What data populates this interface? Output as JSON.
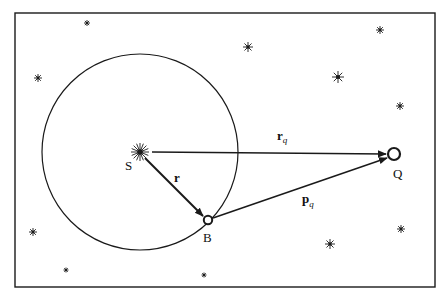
{
  "diagram": {
    "colors": {
      "stroke": "#1a1a1a",
      "background": "#ffffff"
    },
    "frame": {
      "x": 15,
      "y": 13,
      "width": 420,
      "height": 274
    },
    "circle": {
      "cx": 140,
      "cy": 152,
      "r": 98
    },
    "points": {
      "S": {
        "x": 140,
        "y": 152,
        "label": "S",
        "icon": "sun-burst"
      },
      "B": {
        "x": 208,
        "y": 220,
        "label": "B",
        "icon": "open-circle"
      },
      "Q": {
        "x": 394,
        "y": 154,
        "label": "Q",
        "icon": "open-circle"
      }
    },
    "vectors": {
      "r": {
        "from": "S",
        "to": "B",
        "label": "r"
      },
      "r_q": {
        "from": "S",
        "to": "Q",
        "label": "r",
        "subscript": "q"
      },
      "p_q": {
        "from": "B",
        "to": "Q",
        "label": "p",
        "subscript": "q"
      }
    },
    "stars": [
      {
        "x": 87,
        "y": 23,
        "size": 3
      },
      {
        "x": 248,
        "y": 47,
        "size": 5
      },
      {
        "x": 380,
        "y": 30,
        "size": 4
      },
      {
        "x": 38,
        "y": 78,
        "size": 4
      },
      {
        "x": 338,
        "y": 77,
        "size": 6
      },
      {
        "x": 400,
        "y": 106,
        "size": 4
      },
      {
        "x": 33,
        "y": 232,
        "size": 4
      },
      {
        "x": 401,
        "y": 229,
        "size": 4
      },
      {
        "x": 330,
        "y": 244,
        "size": 5
      },
      {
        "x": 66,
        "y": 270,
        "size": 2.5
      },
      {
        "x": 204,
        "y": 275,
        "size": 2.5
      }
    ]
  }
}
